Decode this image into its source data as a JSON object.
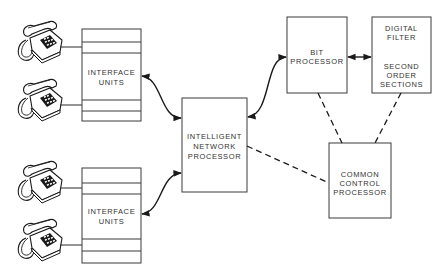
{
  "diagram": {
    "nodes": {
      "interface_units_top": {
        "lines": [
          "INTERFACE",
          "UNITS"
        ]
      },
      "interface_units_bottom": {
        "lines": [
          "INTERFACE",
          "UNITS"
        ]
      },
      "intelligent_network_processor": {
        "lines": [
          "INTELLIGENT",
          "NETWORK",
          "PROCESSOR"
        ]
      },
      "bit_processor": {
        "lines": [
          "BIT",
          "PROCESSOR"
        ]
      },
      "digital_filter": {
        "lines": [
          "DIGITAL",
          "FILTER",
          "",
          "SECOND",
          "ORDER",
          "SECTIONS"
        ]
      },
      "common_control_processor": {
        "lines": [
          "COMMON",
          "CONTROL",
          "PROCESSOR"
        ]
      }
    },
    "telephones": [
      {
        "id": "phone-1",
        "connected_to": "interface_units_top"
      },
      {
        "id": "phone-2",
        "connected_to": "interface_units_top"
      },
      {
        "id": "phone-3",
        "connected_to": "interface_units_bottom"
      },
      {
        "id": "phone-4",
        "connected_to": "interface_units_bottom"
      }
    ],
    "edges": [
      {
        "from": "interface_units_top",
        "to": "intelligent_network_processor",
        "style": "solid-curve",
        "arrows": "both"
      },
      {
        "from": "interface_units_bottom",
        "to": "intelligent_network_processor",
        "style": "solid-curve",
        "arrows": "both"
      },
      {
        "from": "intelligent_network_processor",
        "to": "bit_processor",
        "style": "solid-curve",
        "arrows": "both"
      },
      {
        "from": "bit_processor",
        "to": "digital_filter",
        "style": "solid",
        "arrows": "both"
      },
      {
        "from": "intelligent_network_processor",
        "to": "common_control_processor",
        "style": "dashed",
        "arrows": "none"
      },
      {
        "from": "bit_processor",
        "to": "common_control_processor",
        "style": "dashed",
        "arrows": "none"
      },
      {
        "from": "digital_filter",
        "to": "common_control_processor",
        "style": "dashed",
        "arrows": "none"
      }
    ]
  }
}
